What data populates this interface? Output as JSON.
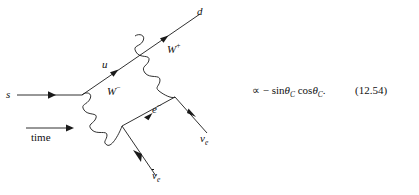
{
  "figure": {
    "type": "feynman-diagram",
    "time_axis_label": "time",
    "line_color": "#1a1a1a",
    "background_color": "#ffffff"
  },
  "labels": {
    "s_quark": "s",
    "u_quark": "u",
    "d_quark": "d",
    "w_plus": "W",
    "w_plus_charge": "+",
    "w_minus": "W",
    "w_minus_charge": "−",
    "electron": "e",
    "electron_charge": "−",
    "neutrino": "ν",
    "neutrino_sub": "e",
    "antineutrino": "ν",
    "antineutrino_sub": "e"
  },
  "equation": {
    "proportional": "∝",
    "minus": "−",
    "sin": "sin",
    "theta_1": "θ",
    "theta_1_sub": "C",
    "cos": "cos",
    "theta_2": "θ",
    "theta_2_sub": "C",
    "period": ".",
    "number": "(12.54)"
  }
}
